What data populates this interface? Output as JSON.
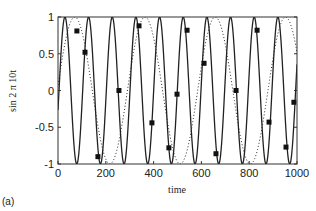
{
  "panel_label": "(a)",
  "chart_data": {
    "type": "line",
    "title": "",
    "xlabel": "time",
    "ylabel": "sin 2 π 10t",
    "xlim": [
      0,
      1000
    ],
    "ylim": [
      -1,
      1
    ],
    "x_ticks": [
      0,
      200,
      400,
      600,
      800,
      1000
    ],
    "x_tick_labels": [
      "0",
      "200",
      "400",
      "600",
      "800",
      "1000"
    ],
    "y_ticks": [
      1,
      0.5,
      0,
      -0.5,
      -1
    ],
    "y_tick_labels": [
      "1",
      "0.5",
      "0",
      "-0.5",
      "-1"
    ],
    "grid": false,
    "legend": null,
    "series": [
      {
        "name": "continuous signal",
        "style": "solid",
        "function": "sin",
        "period": 99,
        "phase_peak_t": 29
      },
      {
        "name": "aliased signal",
        "style": "dotted",
        "function": "sin",
        "period": 294,
        "phase_peak_t": 70
      },
      {
        "name": "samples",
        "style": "square-markers",
        "x": [
          79,
          113,
          167,
          255,
          339,
          393,
          464,
          498,
          540,
          611,
          661,
          745,
          833,
          883,
          954,
          987
        ],
        "y": [
          0.81,
          0.52,
          -0.9,
          0.0,
          0.88,
          -0.44,
          -0.78,
          -0.05,
          0.82,
          0.37,
          -0.86,
          0.0,
          0.82,
          -0.43,
          -0.77,
          -0.16
        ]
      }
    ]
  }
}
